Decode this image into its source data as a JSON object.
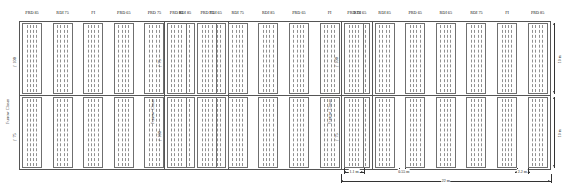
{
  "figure": {
    "type": "field-plot-layout",
    "axis_labels": {
      "furrow_closer": "Furrow Closer",
      "setting_100": "(' 100",
      "setting_75": "(' 75"
    },
    "blocks": [
      {
        "id": "block-1",
        "rows": [
          {
            "closer_setting": "(' 100",
            "treatments": [
              "PRD 85",
              "RDI 75",
              "FI",
              "PRD 65",
              "PRD 75",
              "RDI 85",
              "RDI 65"
            ]
          },
          {
            "closer_setting": "(' 75",
            "treatments": [
              "PRD 85",
              "RDI 75",
              "FI",
              "PRD 65",
              "PRD 75",
              "RDI 85",
              "RDI 65"
            ]
          }
        ]
      },
      {
        "id": "block-2",
        "rows": [
          {
            "closer_setting": "(' 75",
            "treatments": [
              "PRD 85",
              "PRD 75",
              "RDI 75",
              "RDI 85",
              "PRD 65",
              "FI",
              "RDI 65"
            ]
          },
          {
            "closer_setting": "(' 100",
            "treatments": [
              "PRD 85",
              "PRD 75",
              "RDI 75",
              "RDI 85",
              "PRD 65",
              "FI",
              "RDI 65"
            ]
          }
        ]
      },
      {
        "id": "block-3",
        "rows": [
          {
            "closer_setting": "(' 100",
            "treatments": [
              "PRD 75",
              "RDI 85",
              "PRD 65",
              "RDI 65",
              "RDI 75",
              "FI",
              "PRD 85"
            ]
          },
          {
            "closer_setting": "(' 75",
            "treatments": [
              "PRD 75",
              "RDI 85",
              "PRD 65",
              "RDI 65",
              "RDI 75",
              "FI",
              "PRD 85"
            ]
          }
        ]
      }
    ],
    "dimensions": {
      "plot_width": "1.1 m",
      "row_spacing": "0.55 m",
      "plot_gap": "2.2 m",
      "block_length": "22 m",
      "row_height_upper": "10 m",
      "row_height_lower": "10 m"
    },
    "rows_per_plot": 4
  }
}
